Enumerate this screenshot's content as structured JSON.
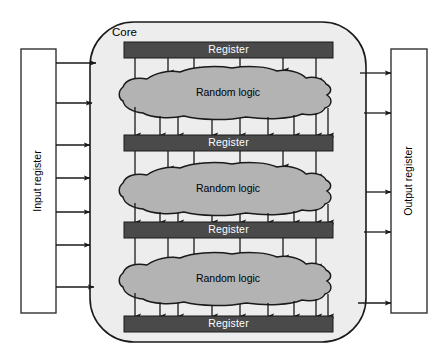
{
  "diagram": {
    "core": {
      "label": "Core",
      "fill_color": "#ededed",
      "stroke_color": "#1a1a1a"
    },
    "input_register": {
      "label": "Input register",
      "fill_color": "#ffffff",
      "stroke_color": "#333333",
      "arrow_count": 7
    },
    "output_register": {
      "label": "Output register",
      "fill_color": "#ffffff",
      "stroke_color": "#333333",
      "arrow_count": 5
    },
    "register_bars": [
      {
        "label": "Register"
      },
      {
        "label": "Register"
      },
      {
        "label": "Register"
      },
      {
        "label": "Register"
      }
    ],
    "logic_blocks": [
      {
        "label": "Random logic"
      },
      {
        "label": "Random logic"
      },
      {
        "label": "Random logic"
      }
    ],
    "colors": {
      "register_fill": "#4a4a4a",
      "register_text": "#ffffff",
      "logic_fill": "#b3b3b3",
      "logic_stroke": "#1a1a1a",
      "core_fill": "#ededed",
      "arrow": "#1a1a1a",
      "background": "#ffffff"
    },
    "stage_sequence": [
      "Input register",
      "Register",
      "Random logic",
      "Register",
      "Random logic",
      "Register",
      "Random logic",
      "Register",
      "Output register"
    ]
  }
}
